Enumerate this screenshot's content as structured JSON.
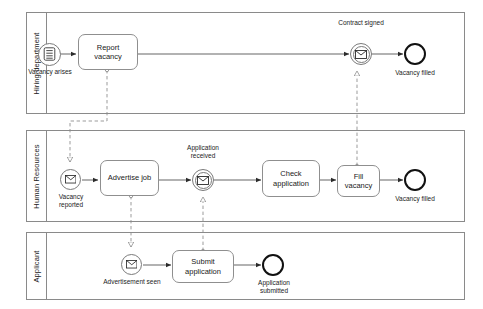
{
  "diagram": {
    "type": "bpmn-collaboration",
    "stroke_color": "#8a8a8a",
    "text_color": "#1a1a1a",
    "end_event_color": "#111111",
    "pools": [
      {
        "id": "hiring-department",
        "label": "Hiring department"
      },
      {
        "id": "human-resources",
        "label": "Human Resources"
      },
      {
        "id": "applicant",
        "label": "Applicant"
      }
    ],
    "elements": {
      "vacancy_arises": {
        "label": "Vacancy arises",
        "type": "conditional-start-event",
        "icon": "rule-document-icon"
      },
      "report_vacancy": {
        "label": "Report vacancy",
        "type": "task"
      },
      "contract_signed": {
        "label": "Contract signed",
        "type": "intermediate-message-catch-event",
        "icon": "envelope-icon"
      },
      "vacancy_filled_hd": {
        "label": "Vacancy filled",
        "type": "end-event"
      },
      "vacancy_reported": {
        "label": "Vacancy reported",
        "type": "message-start-event",
        "icon": "envelope-icon"
      },
      "advertise_job": {
        "label": "Advertise job",
        "type": "task"
      },
      "application_received": {
        "label": "Application received",
        "type": "intermediate-message-catch-event",
        "icon": "envelope-icon"
      },
      "check_application": {
        "label": "Check application",
        "type": "task"
      },
      "fill_vacancy": {
        "label": "Fill vacancy",
        "type": "task"
      },
      "vacancy_filled_hr": {
        "label": "Vacancy filled",
        "type": "end-event"
      },
      "advertisement_seen": {
        "label": "Advertisement seen",
        "type": "message-start-event",
        "icon": "envelope-icon"
      },
      "submit_application": {
        "label": "Submit application",
        "type": "task"
      },
      "application_submitted": {
        "label": "Application submitted",
        "type": "end-event"
      }
    },
    "message_flows": [
      {
        "from": "report_vacancy",
        "to": "vacancy_reported"
      },
      {
        "from": "advertise_job",
        "to": "advertisement_seen"
      },
      {
        "from": "submit_application",
        "to": "application_received"
      },
      {
        "from": "fill_vacancy",
        "to": "contract_signed"
      }
    ],
    "sequence_flows": [
      {
        "from": "vacancy_arises",
        "to": "report_vacancy"
      },
      {
        "from": "report_vacancy",
        "to": "contract_signed"
      },
      {
        "from": "contract_signed",
        "to": "vacancy_filled_hd"
      },
      {
        "from": "vacancy_reported",
        "to": "advertise_job"
      },
      {
        "from": "advertise_job",
        "to": "application_received"
      },
      {
        "from": "application_received",
        "to": "check_application"
      },
      {
        "from": "check_application",
        "to": "fill_vacancy"
      },
      {
        "from": "fill_vacancy",
        "to": "vacancy_filled_hr"
      },
      {
        "from": "advertisement_seen",
        "to": "submit_application"
      },
      {
        "from": "submit_application",
        "to": "application_submitted"
      }
    ]
  }
}
